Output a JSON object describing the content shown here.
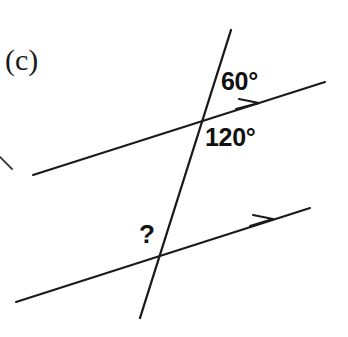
{
  "figure": {
    "part_label": "(c)",
    "background_color": "#ffffff",
    "stroke_color": "#1a1a1a",
    "label_color": "#111111",
    "width": 348,
    "height": 337
  },
  "labels": {
    "angle_upper_above": "60°",
    "angle_upper_below": "120°",
    "angle_lower_unknown": "?"
  },
  "geometry": {
    "upper_parallel_line": {
      "name": "upper-parallel-line",
      "x1": 33,
      "y1": 175,
      "x2": 325,
      "y2": 82,
      "arrow_x": 256,
      "arrow_y": 104,
      "arrow_direction": "right-up"
    },
    "lower_parallel_line": {
      "name": "lower-parallel-line",
      "x1": 16,
      "y1": 302,
      "x2": 310,
      "y2": 208,
      "arrow_x": 269,
      "arrow_y": 221,
      "arrow_direction": "right-up"
    },
    "transversal_line": {
      "name": "transversal-line",
      "x1": 231,
      "y1": 30,
      "x2": 140,
      "y2": 318
    },
    "intersection_upper": {
      "x": 198,
      "y": 119
    },
    "intersection_lower": {
      "x": 159,
      "y": 255
    },
    "stray_mark": {
      "x1": 0,
      "y1": 157,
      "x2": 12,
      "y2": 169
    }
  }
}
